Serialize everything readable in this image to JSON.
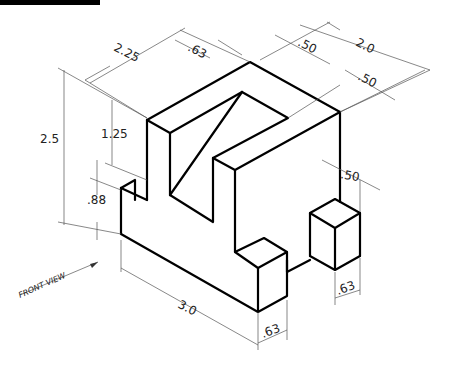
{
  "drawing": {
    "type": "isometric technical drawing",
    "view_label": "FRONT VIEW",
    "dimensions": {
      "overall_height": "2.5",
      "upright_height": "1.25",
      "base_height": ".88",
      "depth_left": "2.25",
      "slot_width": ".63",
      "top_width_a": ".50",
      "top_width_b": "2.0",
      "top_width_c": ".50",
      "right_offset": ".50",
      "overall_length": "3.0",
      "front_cube_width": ".63",
      "right_cube_width": ".63"
    }
  }
}
